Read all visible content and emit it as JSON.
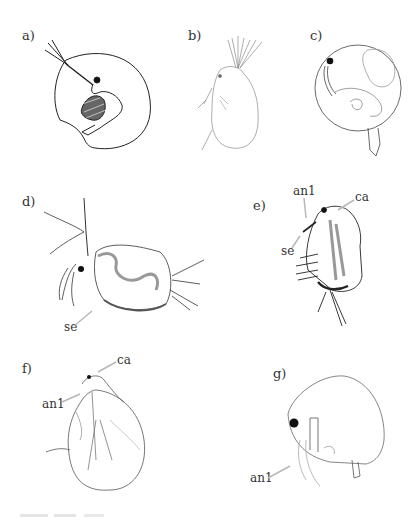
{
  "figure": {
    "panels": [
      {
        "id": "a",
        "label": "a)",
        "annotations": []
      },
      {
        "id": "b",
        "label": "b)",
        "annotations": []
      },
      {
        "id": "c",
        "label": "c)",
        "annotations": []
      },
      {
        "id": "d",
        "label": "d)",
        "annotations": [
          "se"
        ]
      },
      {
        "id": "e",
        "label": "e)",
        "annotations": [
          "an1",
          "ca",
          "se"
        ]
      },
      {
        "id": "f",
        "label": "f)",
        "annotations": [
          "ca",
          "an1"
        ]
      },
      {
        "id": "g",
        "label": "g)",
        "annotations": [
          "an1"
        ]
      }
    ],
    "annotation_labels": {
      "se": "se",
      "an1": "an1",
      "ca": "ca"
    },
    "colors": {
      "ink": "#222222",
      "light_ink": "#8a8a8a",
      "arrow": "#b8b8b8",
      "background": "#ffffff"
    }
  }
}
